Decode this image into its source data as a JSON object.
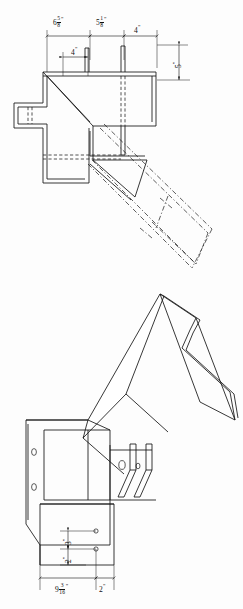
{
  "sheet": {
    "title": "Structural steel beam-to-column skewed connection detail",
    "background_color": "#fdfdfd",
    "line_color": "#111111",
    "width_px": 243,
    "height_px": 609
  },
  "views": {
    "top": {
      "name": "Plan view with hidden (dashed) outline of skewed beam",
      "label": "upper-view"
    },
    "bottom": {
      "name": "Isometric / pictorial view of the connection assembly",
      "label": "lower-view"
    }
  },
  "dimensions": {
    "top_view": [
      {
        "id": "d1",
        "whole": "6",
        "num": "5",
        "den": "8",
        "unit": "\"",
        "text": "6 5/8\""
      },
      {
        "id": "d2",
        "whole": "5",
        "num": "1",
        "den": "8",
        "unit": "\"",
        "text": "5 1/8\""
      },
      {
        "id": "d3",
        "whole": "4",
        "num": "",
        "den": "",
        "unit": "\"",
        "text": "4\""
      },
      {
        "id": "d4",
        "whole": "4",
        "num": "",
        "den": "",
        "unit": "\"",
        "text": "4\""
      },
      {
        "id": "d5",
        "whole": "5",
        "num": "",
        "den": "",
        "unit": "\"",
        "text": "5\"",
        "rotated": true
      }
    ],
    "bottom_view": [
      {
        "id": "d6",
        "whole": "3",
        "num": "",
        "den": "",
        "unit": "\"",
        "text": "3\"",
        "rotated": true
      },
      {
        "id": "d7",
        "whole": "2",
        "num": "",
        "den": "",
        "unit": "\"",
        "text": "2\"",
        "rotated": true
      },
      {
        "id": "d8",
        "whole": "9",
        "num": "3",
        "den": "16",
        "unit": "\"",
        "text": "9 3/16\""
      },
      {
        "id": "d9",
        "whole": "2",
        "num": "",
        "den": "",
        "unit": "\"",
        "text": "2\""
      }
    ]
  },
  "features": {
    "bolt_holes_left_flange": 2,
    "bolt_holes_web": 2,
    "bolt_holes_lower_plate": 2,
    "hidden_line_style": "dashed",
    "visible_line_style": "solid"
  }
}
